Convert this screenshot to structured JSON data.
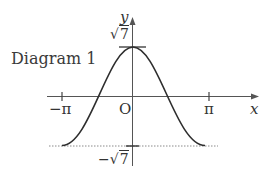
{
  "diagram": {
    "title": "Diagram 1",
    "x_axis_label": "x",
    "y_axis_label": "y",
    "origin_label": "O",
    "x_ticks": [
      {
        "label": "−π",
        "value": "-pi"
      },
      {
        "label": "π",
        "value": "pi"
      }
    ],
    "y_ticks": [
      {
        "prefix": "",
        "radical": "√",
        "radicand": "7",
        "value": "sqrt(7)"
      },
      {
        "prefix": "−",
        "radical": "√",
        "radicand": "7",
        "value": "-sqrt(7)"
      }
    ],
    "curve": {
      "description": "cosine-shaped curve, maximum sqrt(7) at x=0, minimum -sqrt(7) at x=-pi and x=pi",
      "x_range": [
        "-pi",
        "pi"
      ],
      "y_max": "sqrt(7)",
      "y_min": "-sqrt(7)"
    },
    "reference_lines": [
      {
        "type": "dotted",
        "at_y": "-sqrt(7)"
      }
    ],
    "colors": {
      "curve": "#333333",
      "axes": "#555555",
      "dotted": "#888888",
      "text": "#333333"
    }
  }
}
